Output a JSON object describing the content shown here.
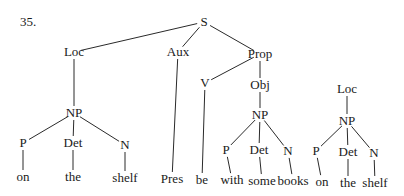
{
  "example_number": "35.",
  "nodes": {
    "S": {
      "label": "S",
      "x": 204,
      "y": 22
    },
    "Loc1": {
      "label": "Loc",
      "x": 74,
      "y": 52
    },
    "Aux": {
      "label": "Aux",
      "x": 178,
      "y": 52
    },
    "Prop": {
      "label": "Prop",
      "x": 260,
      "y": 54
    },
    "V": {
      "label": "V",
      "x": 205,
      "y": 83
    },
    "Obj": {
      "label": "Obj",
      "x": 260,
      "y": 85
    },
    "Loc2": {
      "label": "Loc",
      "x": 347,
      "y": 89
    },
    "NP1": {
      "label": "NP",
      "x": 74,
      "y": 113
    },
    "NP2": {
      "label": "NP",
      "x": 260,
      "y": 115
    },
    "NP3": {
      "label": "NP",
      "x": 347,
      "y": 121
    },
    "P1": {
      "label": "P",
      "x": 23,
      "y": 143
    },
    "Det1": {
      "label": "Det",
      "x": 73,
      "y": 143
    },
    "N1": {
      "label": "N",
      "x": 125,
      "y": 145
    },
    "P2": {
      "label": "P",
      "x": 226,
      "y": 150
    },
    "Det2": {
      "label": "Det",
      "x": 259,
      "y": 150
    },
    "N2": {
      "label": "N",
      "x": 288,
      "y": 151
    },
    "P3": {
      "label": "P",
      "x": 316,
      "y": 151
    },
    "Det3": {
      "label": "Det",
      "x": 348,
      "y": 152
    },
    "N3": {
      "label": "N",
      "x": 374,
      "y": 153
    },
    "w_on1": {
      "label": "on",
      "x": 23,
      "y": 177
    },
    "w_the1": {
      "label": "the",
      "x": 73,
      "y": 177
    },
    "w_shelf1": {
      "label": "shelf",
      "x": 125,
      "y": 178
    },
    "w_Pres": {
      "label": "Pres",
      "x": 172,
      "y": 179
    },
    "w_be": {
      "label": "be",
      "x": 202,
      "y": 180
    },
    "w_with": {
      "label": "with",
      "x": 232,
      "y": 180
    },
    "w_some": {
      "label": "some",
      "x": 262,
      "y": 181
    },
    "w_books": {
      "label": "books",
      "x": 293,
      "y": 181
    },
    "w_on2": {
      "label": "on",
      "x": 322,
      "y": 182
    },
    "w_the2": {
      "label": "the",
      "x": 348,
      "y": 183
    },
    "w_shelf3": {
      "label": "shelf",
      "x": 375,
      "y": 183
    }
  },
  "edges": [
    [
      "S",
      "Loc1"
    ],
    [
      "S",
      "Aux"
    ],
    [
      "S",
      "Prop"
    ],
    [
      "Loc1",
      "NP1"
    ],
    [
      "NP1",
      "P1"
    ],
    [
      "NP1",
      "Det1"
    ],
    [
      "NP1",
      "N1"
    ],
    [
      "P1",
      "w_on1"
    ],
    [
      "Det1",
      "w_the1"
    ],
    [
      "N1",
      "w_shelf1"
    ],
    [
      "Aux",
      "w_Pres"
    ],
    [
      "Prop",
      "V"
    ],
    [
      "Prop",
      "Obj"
    ],
    [
      "V",
      "w_be"
    ],
    [
      "Obj",
      "NP2"
    ],
    [
      "NP2",
      "P2"
    ],
    [
      "NP2",
      "Det2"
    ],
    [
      "NP2",
      "N2"
    ],
    [
      "P2",
      "w_with"
    ],
    [
      "Det2",
      "w_some"
    ],
    [
      "N2",
      "w_books"
    ],
    [
      "Loc2",
      "NP3"
    ],
    [
      "NP3",
      "P3"
    ],
    [
      "NP3",
      "Det3"
    ],
    [
      "NP3",
      "N3"
    ],
    [
      "P3",
      "w_on2"
    ],
    [
      "Det3",
      "w_the2"
    ],
    [
      "N3",
      "w_shelf3"
    ]
  ]
}
